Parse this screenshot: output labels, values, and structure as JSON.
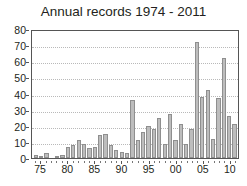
{
  "chart_data": {
    "type": "bar",
    "title": "Annual records 1974 - 2011",
    "xlabel": "",
    "ylabel": "",
    "ylim": [
      0,
      80
    ],
    "ytick_labels": [
      "0",
      "10",
      "20",
      "30",
      "40",
      "50",
      "60",
      "70",
      "80"
    ],
    "ytick_values": [
      0,
      10,
      20,
      30,
      40,
      50,
      60,
      70,
      80
    ],
    "xtick_labels": [
      "75",
      "80",
      "85",
      "90",
      "95",
      "00",
      "05",
      "10"
    ],
    "xtick_values": [
      1975,
      1980,
      1985,
      1990,
      1995,
      2000,
      2005,
      2010
    ],
    "grid": true,
    "legend": null,
    "bar_color": "#bdbdbd",
    "bar_edge_color": "#8f8f8f",
    "categories": [
      "1974",
      "1975",
      "1976",
      "1977",
      "1978",
      "1979",
      "1980",
      "1981",
      "1982",
      "1983",
      "1984",
      "1985",
      "1986",
      "1987",
      "1988",
      "1989",
      "1990",
      "1991",
      "1992",
      "1993",
      "1994",
      "1995",
      "1996",
      "1997",
      "1998",
      "1999",
      "2000",
      "2001",
      "2002",
      "2003",
      "2004",
      "2005",
      "2006",
      "2007",
      "2008",
      "2009",
      "2010",
      "2011"
    ],
    "values": [
      2,
      1,
      3,
      0,
      1,
      2,
      7,
      8,
      11,
      9,
      6,
      7,
      14,
      15,
      8,
      5,
      4,
      3,
      36,
      11,
      16,
      20,
      18,
      25,
      9,
      27,
      11,
      21,
      9,
      18,
      72,
      38,
      42,
      12,
      37,
      62,
      26,
      21
    ]
  }
}
